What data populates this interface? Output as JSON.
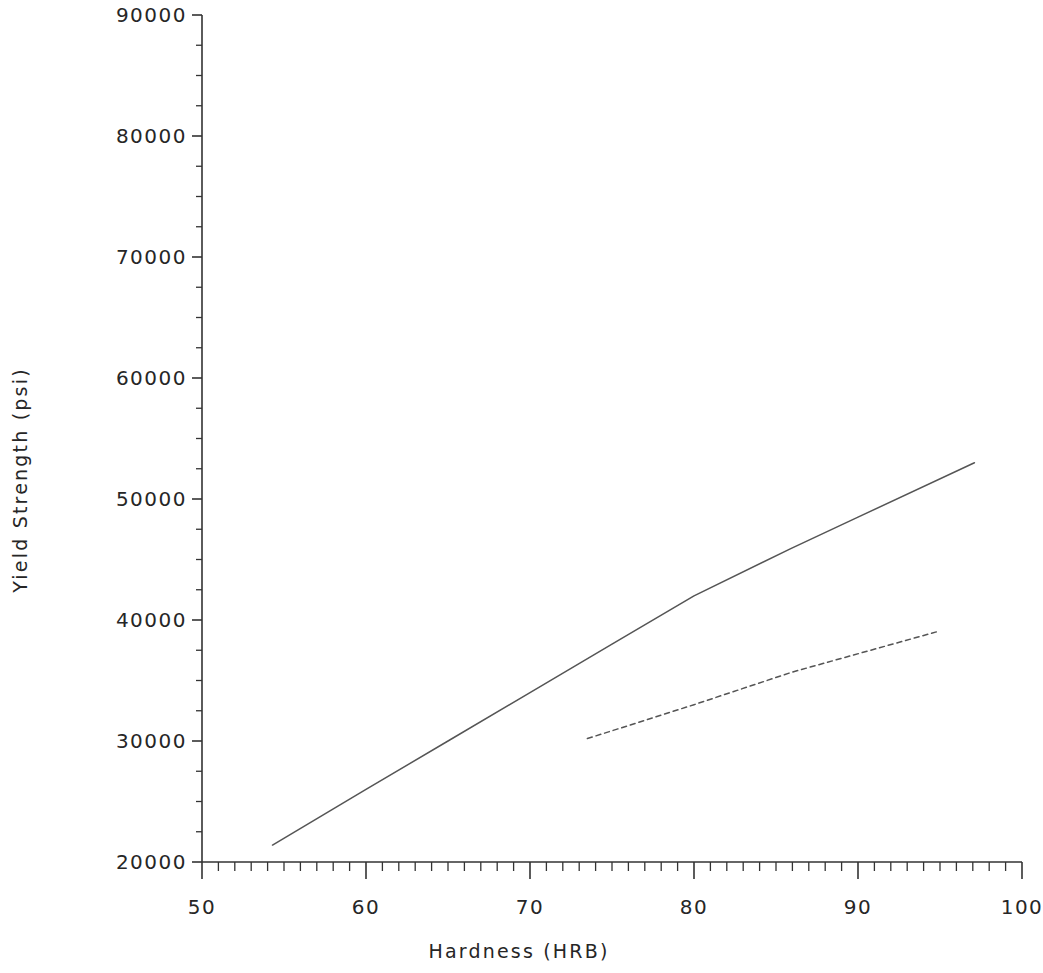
{
  "chart_data": {
    "type": "line",
    "title": "",
    "xlabel": "Hardness (HRB)",
    "ylabel": "Yield Strength (psi)",
    "xlim": [
      50,
      100
    ],
    "ylim": [
      20000,
      90000
    ],
    "xticks": [
      50,
      60,
      70,
      80,
      90,
      100
    ],
    "xtick_labels": [
      "50",
      "60",
      "70",
      "80",
      "90",
      "100"
    ],
    "yticks": [
      20000,
      30000,
      40000,
      50000,
      60000,
      70000,
      80000,
      90000
    ],
    "ytick_labels": [
      "20000",
      "30000",
      "40000",
      "50000",
      "60000",
      "70000",
      "80000",
      "90000"
    ],
    "x_minor_tick_step": 1,
    "y_minor_tick_step": 2500,
    "grid": false,
    "legend": "none",
    "axes_color": "#333333",
    "series": [
      {
        "name": "solid-curve",
        "style": "solid",
        "color": "#555555",
        "points": [
          {
            "x": 54.3,
            "y": 21400
          },
          {
            "x": 60.0,
            "y": 26000
          },
          {
            "x": 65.0,
            "y": 30000
          },
          {
            "x": 70.0,
            "y": 34000
          },
          {
            "x": 75.0,
            "y": 38000
          },
          {
            "x": 80.0,
            "y": 42000
          },
          {
            "x": 85.9,
            "y": 45900
          },
          {
            "x": 90.0,
            "y": 48500
          },
          {
            "x": 97.1,
            "y": 53000
          }
        ]
      },
      {
        "name": "dashed-curve",
        "style": "dashed",
        "color": "#555555",
        "points": [
          {
            "x": 73.5,
            "y": 30200
          },
          {
            "x": 80.0,
            "y": 33000
          },
          {
            "x": 86.0,
            "y": 35700
          },
          {
            "x": 95.0,
            "y": 39100
          }
        ]
      }
    ]
  },
  "axis": {
    "y_title": "Yield Strength (psi)",
    "x_title": "Hardness (HRB)"
  }
}
